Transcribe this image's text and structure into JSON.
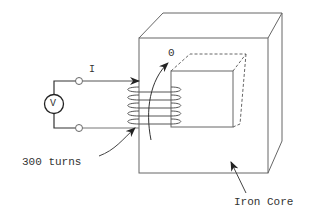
{
  "labels": {
    "current": "I",
    "flux": "0",
    "voltmeter": "V",
    "turns": "300 turns",
    "core": "Iron Core"
  },
  "colors": {
    "line": "#666666",
    "wire": "#333333",
    "text": "#333333"
  }
}
